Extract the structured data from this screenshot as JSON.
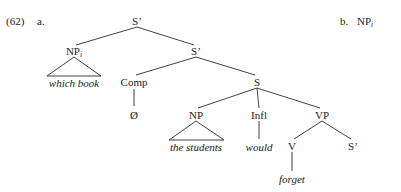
{
  "figure": {
    "example_number": "(62)",
    "part_a_label": "a.",
    "part_b_label": "b.",
    "part_b_node": "NP",
    "part_b_subscript": "i",
    "type": "syntax-tree",
    "ink_color": "#2b2b2b",
    "background_color": "#ffffff"
  },
  "tree": {
    "nodes": [
      {
        "id": "s-bar-top",
        "label": "S’",
        "subscript": "",
        "x": 137,
        "y": 22,
        "italic": false
      },
      {
        "id": "np-i",
        "label": "NP",
        "subscript": "i",
        "x": 74,
        "y": 52,
        "italic": false
      },
      {
        "id": "s-bar-second",
        "label": "S’",
        "subscript": "",
        "x": 196,
        "y": 52,
        "italic": false
      },
      {
        "id": "comp",
        "label": "Comp",
        "subscript": "",
        "x": 134,
        "y": 83,
        "italic": false
      },
      {
        "id": "s",
        "label": "S",
        "subscript": "",
        "x": 257,
        "y": 83,
        "italic": false
      },
      {
        "id": "np-subject",
        "label": "NP",
        "subscript": "",
        "x": 196,
        "y": 116,
        "italic": false
      },
      {
        "id": "infl",
        "label": "Infl",
        "subscript": "",
        "x": 259,
        "y": 116,
        "italic": false
      },
      {
        "id": "vp",
        "label": "VP",
        "subscript": "",
        "x": 322,
        "y": 116,
        "italic": false
      },
      {
        "id": "v",
        "label": "V",
        "subscript": "",
        "x": 292,
        "y": 147,
        "italic": false
      },
      {
        "id": "s-bar-object",
        "label": "S’",
        "subscript": "",
        "x": 353,
        "y": 147,
        "italic": false
      }
    ],
    "terminals": [
      {
        "id": "which-book",
        "text": "which book",
        "x": 74,
        "y": 84
      },
      {
        "id": "null-comp",
        "text": "Ø",
        "x": 134,
        "y": 116,
        "italic": false
      },
      {
        "id": "the-students",
        "text": "the students",
        "x": 196,
        "y": 148
      },
      {
        "id": "would",
        "text": "would",
        "x": 259,
        "y": 148
      },
      {
        "id": "forget",
        "text": "forget",
        "x": 292,
        "y": 180
      }
    ],
    "branches": [
      {
        "from": "s-bar-top",
        "to": "np-i"
      },
      {
        "from": "s-bar-top",
        "to": "s-bar-second"
      },
      {
        "from": "s-bar-second",
        "to": "comp"
      },
      {
        "from": "s-bar-second",
        "to": "s"
      },
      {
        "from": "s",
        "to": "np-subject"
      },
      {
        "from": "s",
        "to": "infl"
      },
      {
        "from": "s",
        "to": "vp"
      },
      {
        "from": "vp",
        "to": "v"
      },
      {
        "from": "vp",
        "to": "s-bar-object"
      },
      {
        "from": "comp",
        "to": "null-comp"
      },
      {
        "from": "infl",
        "to": "would"
      },
      {
        "from": "v",
        "to": "forget"
      }
    ],
    "triangles": [
      {
        "id": "triangle-which-book",
        "apex_x": 74,
        "apex_y": 57,
        "left_x": 47,
        "right_x": 101,
        "base_y": 76
      },
      {
        "id": "triangle-the-students",
        "apex_x": 196,
        "apex_y": 121,
        "left_x": 169,
        "right_x": 224,
        "base_y": 140
      }
    ]
  }
}
